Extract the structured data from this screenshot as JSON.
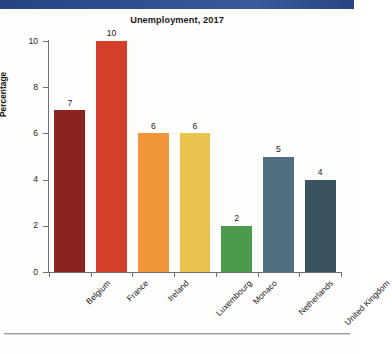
{
  "page": {
    "background_color": "#fdfdfc",
    "top_band_color": "#2a4a8b",
    "rule_color": "#9b9b9b"
  },
  "chart_data": {
    "type": "bar",
    "title": "Unemployment, 2017",
    "xlabel": "",
    "ylabel": "Percentage",
    "categories": [
      "Belgium",
      "France",
      "Ireland",
      "Luxembourg",
      "Monaco",
      "Netherlands",
      "United Kingdom"
    ],
    "values": [
      7,
      10,
      6,
      6,
      2,
      5,
      4
    ],
    "value_labels": [
      "7",
      "10",
      "6",
      "6",
      "2",
      "5",
      "4"
    ],
    "colors": [
      "#8b2321",
      "#d2402c",
      "#f2963c",
      "#e8c44e",
      "#4c9a4e",
      "#516d80",
      "#39535f"
    ],
    "ylim": [
      0,
      10
    ],
    "yticks": [
      0,
      2,
      4,
      6,
      8,
      10
    ],
    "ytick_labels": [
      "0",
      "2",
      "4",
      "6",
      "8",
      "10"
    ],
    "grid": false,
    "legend": "none",
    "xtick_label_rotation": -45
  }
}
